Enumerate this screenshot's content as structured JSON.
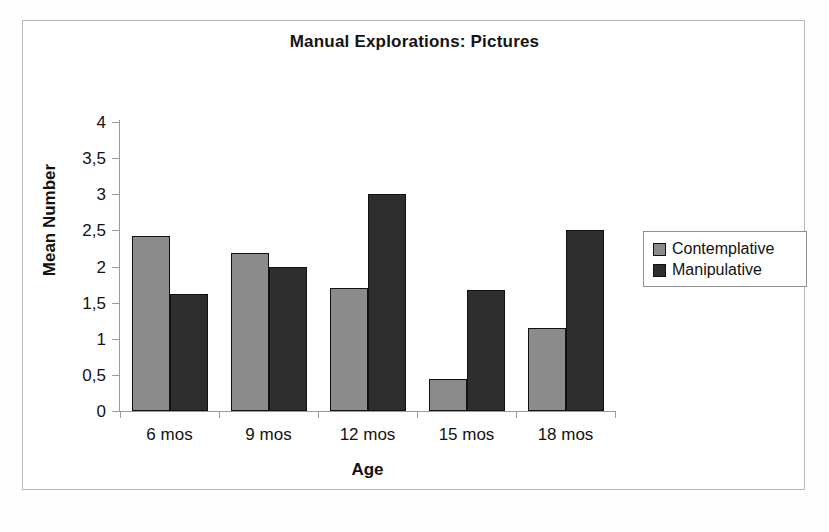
{
  "chart_data": {
    "type": "bar",
    "title": "Manual Explorations: Pictures",
    "xlabel": "Age",
    "ylabel": "Mean Number",
    "categories": [
      "6 mos",
      "9 mos",
      "12 mos",
      "15 mos",
      "18 mos"
    ],
    "series": [
      {
        "name": "Contemplative",
        "color": "#8b8b8b",
        "values": [
          2.42,
          2.19,
          1.7,
          0.45,
          1.15
        ]
      },
      {
        "name": "Manipulative",
        "color": "#2e2e2e",
        "values": [
          1.62,
          2.0,
          3.0,
          1.67,
          2.51
        ]
      }
    ],
    "ylim": [
      0,
      4
    ],
    "ytick_values": [
      0,
      0.5,
      1,
      1.5,
      2,
      2.5,
      3,
      3.5,
      4
    ],
    "ytick_labels": [
      "0",
      "0,5",
      "1",
      "1,5",
      "2",
      "2,5",
      "3",
      "3,5",
      "4"
    ],
    "grid": false,
    "legend_position": "right",
    "decimal_separator": ","
  }
}
